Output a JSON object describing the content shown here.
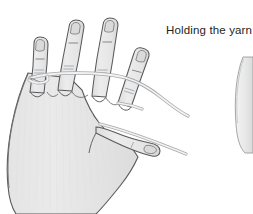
{
  "figure": {
    "caption": "Holding the yarn",
    "colors": {
      "background": "#ffffff",
      "skin_fill": "#e6e6e6",
      "skin_fill_light": "#efefef",
      "skin_shadow": "#d2d2d2",
      "outline": "#58595b",
      "outline_soft": "#8a8c8e",
      "nail_fill": "#dcdcdc",
      "yarn_fill": "#ededed",
      "yarn_outline": "#a7a9ac",
      "caption_text": "#231f20"
    },
    "parts": {
      "hand": "left-hand-back-view",
      "fingers": [
        "little-finger",
        "ring-finger",
        "middle-finger",
        "index-finger"
      ],
      "thumb": "thumb",
      "nails": 5,
      "knuckle_creases": 8,
      "yarn_strands": 2,
      "yarn_path": "wrapped-around-little-finger-over-ring-and-middle-under-index-over-thumb"
    },
    "secondary_illustration": {
      "label": "partial-hand-illustration-cropped-right-edge",
      "visible": true
    }
  }
}
